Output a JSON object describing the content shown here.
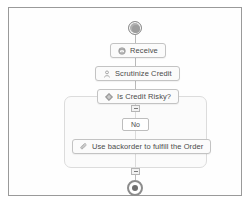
{
  "diagram": {
    "type": "workflow-flowchart",
    "start_event": {
      "name": "start-event",
      "label": ""
    },
    "end_event": {
      "name": "end-event",
      "label": ""
    },
    "nodes": [
      {
        "id": "receive",
        "label": "Receive",
        "icon": "message-receive-icon"
      },
      {
        "id": "scrutinize",
        "label": "Scrutinize Credit",
        "icon": "user-task-icon"
      },
      {
        "id": "decision",
        "label": "Is Credit Risky?",
        "icon": "gateway-diamond-icon"
      },
      {
        "id": "backorder",
        "label": "Use backorder to fulfill the Order",
        "icon": "paperclip-icon"
      }
    ],
    "branch": {
      "condition_label": "No"
    },
    "markers": [
      {
        "id": "marker-top",
        "state": "collapse"
      },
      {
        "id": "marker-bottom",
        "state": "collapse"
      }
    ],
    "colors": {
      "frame_border": "#9a9a9a",
      "node_border": "#c3c3c3",
      "node_fill": "#fbfbfb",
      "connector": "#b9b9b9",
      "container_border": "#dcdcdc",
      "text": "#4a4a4a"
    }
  }
}
